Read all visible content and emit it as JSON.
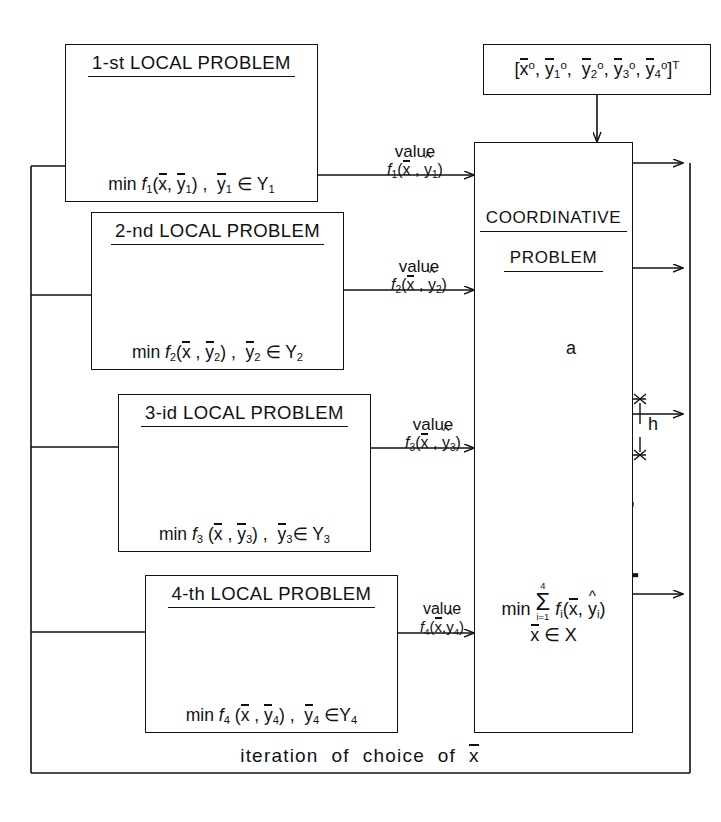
{
  "diagram": {
    "bottom_feedback_label": "iteration  of  choice  of  x̄",
    "stroke_color": "#111111",
    "background": "#ffffff"
  },
  "init_vector": {
    "label": "[x̄°, ȳ₁°, ȳ₂°, ȳ₃°, ȳ₄°]ᵀ"
  },
  "local_problems": [
    {
      "title": "1-st LOCAL  PROBLEM",
      "formula": "min f₁(x̄, ȳ₁) ,  ȳ₁ ∈ Y₁",
      "value_top": "value",
      "value_bottom": "f₁(x̄, ŷ₁)",
      "truss_type": "portal-truss"
    },
    {
      "title": "2-nd LOCAL PROBLEM",
      "formula": "min f₂(x̄ ,  ȳ₂) ,  ȳ₂ ∈ Y₂",
      "value_top": "value",
      "value_bottom": "f₂(x̄, ŷ₂)",
      "truss_type": "portal-truss"
    },
    {
      "title": "3-id LOCAL PROBLEM",
      "formula": "min f₃ (x̄ ,  ȳ₃) ,  ȳ₃∈ Y₃",
      "value_top": "value",
      "value_bottom": "f₃(x̄, ŷ₃)",
      "truss_type": "portal-truss"
    },
    {
      "title": "4-th LOCAL PROBLEM",
      "formula": "min f₄ (x̄ ,  ȳ₄) ,  ȳ₄ ∈Y₄",
      "value_top": "value",
      "value_bottom": "f₄(x̄, ŷ₄)",
      "truss_type": "portal-truss"
    }
  ],
  "coordinative": {
    "title_line1": "COORDINATIVE",
    "title_line2": "PROBLEM",
    "objective": "min Σ(i=1..4) fᵢ(x̄, ŷᵢ)",
    "constraint": "x̄ ∈ X",
    "sum_upper": "4",
    "sum_lower": "i=1",
    "detail_dim_a": "a",
    "detail_dim_h": "h",
    "detail_name": "truss-panel-detail",
    "truss_type": "portal-truss"
  }
}
